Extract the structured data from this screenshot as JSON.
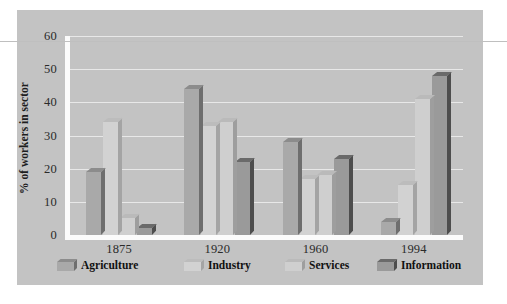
{
  "chart_data": {
    "type": "bar",
    "title": "",
    "subtitle": "",
    "xlabel": "",
    "ylabel": "% of workers in sector",
    "categories": [
      "1875",
      "1920",
      "1960",
      "1994"
    ],
    "series": [
      {
        "name": "Agriculture",
        "values": [
          19,
          44,
          28,
          4
        ],
        "color": "#a9a9a9",
        "top_color": "#8c8c8c",
        "side_color": "#6e6e6e"
      },
      {
        "name": "Industry",
        "values": [
          34,
          33,
          17,
          15
        ],
        "color": "#d2d2d2",
        "top_color": "#bcbcbc",
        "side_color": "#a4a4a4"
      },
      {
        "name": "Services",
        "values": [
          5,
          34,
          18,
          41
        ],
        "color": "#cfcfcf",
        "top_color": "#bababa",
        "side_color": "#9e9e9e"
      },
      {
        "name": "Information",
        "values": [
          2,
          22,
          23,
          48
        ],
        "color": "#9a9a9a",
        "top_color": "#6a6a6a",
        "side_color": "#4d4d4d"
      }
    ],
    "ylim": [
      0,
      60
    ],
    "yticks": [
      0,
      10,
      20,
      30,
      40,
      50,
      60
    ],
    "ytick_labels": [
      "0",
      "10",
      "20",
      "30",
      "40",
      "50",
      "60"
    ],
    "grid": true,
    "grid_axis": "y",
    "legend_position": "bottom",
    "style": "3d-column"
  },
  "figure": {
    "background_color": "#c3c3c3",
    "page_background_color": "#ffffff",
    "axis_line_color": "#fbfbfb",
    "grid_color": "#e8e8e8",
    "text_color": "#2a2a2a"
  }
}
